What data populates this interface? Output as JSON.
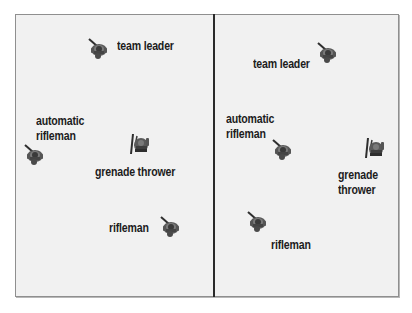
{
  "figure": {
    "panels": [
      {
        "id": "left",
        "members": [
          {
            "role": "team leader",
            "label_lines": [
              "team leader"
            ],
            "pose": "weapon-up-left"
          },
          {
            "role": "automatic rifleman",
            "label_lines": [
              "automatic",
              "rifleman"
            ],
            "pose": "weapon-up-left"
          },
          {
            "role": "grenade thrower",
            "label_lines": [
              "grenade thrower"
            ],
            "pose": "weapon-vertical"
          },
          {
            "role": "rifleman",
            "label_lines": [
              "rifleman"
            ],
            "pose": "weapon-up-left"
          }
        ]
      },
      {
        "id": "right",
        "members": [
          {
            "role": "team leader",
            "label_lines": [
              "team leader"
            ],
            "pose": "weapon-up-left"
          },
          {
            "role": "automatic rifleman",
            "label_lines": [
              "automatic",
              "rifleman"
            ],
            "pose": "weapon-up-left"
          },
          {
            "role": "grenade thrower",
            "label_lines": [
              "grenade",
              "thrower"
            ],
            "pose": "weapon-vertical"
          },
          {
            "role": "rifleman",
            "label_lines": [
              "rifleman"
            ],
            "pose": "weapon-up-left"
          }
        ]
      }
    ],
    "colors": {
      "background": "#f1f1f1",
      "frame_border": "#8f8f8f",
      "divider": "#2a2a2a",
      "label_text": "#1c1c1c",
      "soldier_dark": "#3a3a3a",
      "soldier_mid": "#6a6a6a"
    }
  }
}
